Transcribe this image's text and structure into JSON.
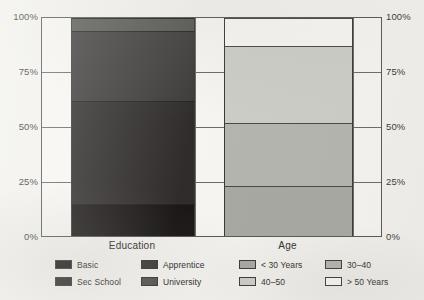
{
  "chart_data": {
    "type": "bar",
    "subtype": "stacked-100-percent",
    "title": "",
    "xlabel": "",
    "ylabel": "",
    "ylim": [
      0,
      100
    ],
    "yticks": [
      0,
      25,
      50,
      75,
      100
    ],
    "ytick_labels": [
      "0%",
      "25%",
      "50%",
      "75%",
      "100%"
    ],
    "dual_axis": true,
    "grid": true,
    "legend_position": "bottom",
    "categories": [
      "Education",
      "Age"
    ],
    "bars": [
      {
        "category": "Education",
        "segments": [
          {
            "name": "Basic",
            "value": 14.5,
            "cum_start": 0.0,
            "cum_end": 14.5,
            "color": "#1a1616"
          },
          {
            "name": "Sec School",
            "value": 47.5,
            "cum_start": 14.5,
            "cum_end": 62.0,
            "color": "#302c2c"
          },
          {
            "name": "Apprentice",
            "value": 32.0,
            "cum_start": 62.0,
            "cum_end": 94.0,
            "color": "#3d3a3a"
          },
          {
            "name": "University",
            "value": 6.0,
            "cum_start": 94.0,
            "cum_end": 100.0,
            "color": "#565652"
          }
        ]
      },
      {
        "category": "Age",
        "segments": [
          {
            "name": "< 30 Years",
            "value": 23.0,
            "cum_start": 0.0,
            "cum_end": 23.0,
            "color": "#a8a8a3"
          },
          {
            "name": "30–40",
            "value": 29.0,
            "cum_start": 23.0,
            "cum_end": 52.0,
            "color": "#b5b5b0"
          },
          {
            "name": "40–50",
            "value": 35.0,
            "cum_start": 52.0,
            "cum_end": 87.0,
            "color": "#cdcdc8"
          },
          {
            "name": "> 50 Years",
            "value": 13.0,
            "cum_start": 87.0,
            "cum_end": 100.0,
            "color": "#f7f6f2"
          }
        ]
      }
    ],
    "series": [
      {
        "name": "Basic",
        "values": [
          14.5,
          null
        ]
      },
      {
        "name": "Sec School",
        "values": [
          47.5,
          null
        ]
      },
      {
        "name": "Apprentice",
        "values": [
          32.0,
          null
        ]
      },
      {
        "name": "University",
        "values": [
          6.0,
          null
        ]
      },
      {
        "name": "< 30 Years",
        "values": [
          null,
          23.0
        ]
      },
      {
        "name": "30–40",
        "values": [
          null,
          29.0
        ]
      },
      {
        "name": "40–50",
        "values": [
          null,
          35.0
        ]
      },
      {
        "name": "> 50 Years",
        "values": [
          null,
          13.0
        ]
      }
    ]
  },
  "axis": {
    "left": {
      "t100": "100%",
      "t75": "75%",
      "t50": "50%",
      "t25": "25%",
      "t0": "0%"
    },
    "right": {
      "t100": "100%",
      "t75": "75%",
      "t50": "50%",
      "t25": "25%",
      "t0": "0%"
    }
  },
  "categories": {
    "education": "Education",
    "age": "Age"
  },
  "legend": {
    "basic": "Basic",
    "apprentice": "Apprentice",
    "sec_school": "Sec School",
    "university": "University",
    "under30": "< 30 Years",
    "thirty_forty": "30–40",
    "forty_fifty": "40–50",
    "over50": "> 50 Years"
  }
}
